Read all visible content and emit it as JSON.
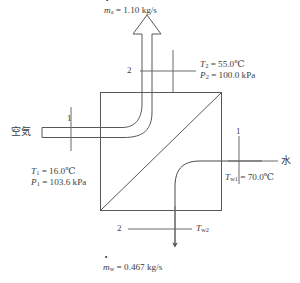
{
  "figure": {
    "line_color": "#555555",
    "text_color": "#3d3d3d",
    "background": "#ffffff"
  },
  "air_outlet": {
    "flow_symbol": "m",
    "flow_sub": "a",
    "flow_text": "= 1.10 kg/s",
    "station": "2",
    "temperature": "= 55.0℃",
    "temperature_symbol": "T",
    "temperature_sub": "2",
    "pressure_symbol": "P",
    "pressure_sub": "2",
    "pressure": "= 100.0 kPa"
  },
  "air_inlet": {
    "fluid_label": "空気",
    "station": "1",
    "temperature_symbol": "T",
    "temperature_sub": "1",
    "temperature": "= 16.0℃",
    "pressure_symbol": "P",
    "pressure_sub": "1",
    "pressure": "= 103.6 kPa"
  },
  "water_inlet": {
    "fluid_label": "水",
    "station": "1",
    "temperature_symbol": "T",
    "temperature_sub": "w1",
    "temperature": "= 70.0℃"
  },
  "water_outlet": {
    "station": "2",
    "temperature_symbol": "T",
    "temperature_sub": "w2",
    "flow_symbol": "m",
    "flow_sub": "w",
    "flow_text": "= 0.467 kg/s"
  },
  "icons": {
    "air_arrow": "up-block-arrow-icon",
    "water_arrow": "down-arrow-icon"
  }
}
